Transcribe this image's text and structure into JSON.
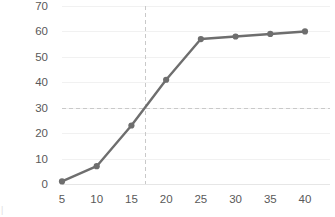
{
  "chart_data": {
    "type": "line",
    "title": "",
    "subtitle": "",
    "xlabel": "",
    "ylabel": "",
    "x": [
      5,
      10,
      15,
      20,
      25,
      30,
      35,
      40
    ],
    "series": [
      {
        "name": "series-1",
        "values": [
          1,
          7,
          23,
          41,
          57,
          58,
          59,
          60
        ],
        "color": "#6e6e6e",
        "marker": "circle"
      }
    ],
    "xlim": [
      5,
      40
    ],
    "ylim": [
      0,
      70
    ],
    "xticks": [
      5,
      10,
      15,
      20,
      25,
      30,
      35,
      40
    ],
    "yticks": [
      0,
      10,
      20,
      30,
      40,
      50,
      60,
      70
    ],
    "xtick_labels": [
      "5",
      "10",
      "15",
      "20",
      "25",
      "30",
      "35",
      "40"
    ],
    "ytick_labels": [
      "0",
      "10",
      "20",
      "30",
      "40",
      "50",
      "60",
      "70"
    ],
    "grid": {
      "horizontal": true,
      "vertical": false,
      "color": "#f1f1f1"
    },
    "legend": {
      "visible": false,
      "position": "none",
      "entries": []
    },
    "annotations": [
      {
        "name": "horizontal-reference-line",
        "orientation": "horizontal",
        "value": 30,
        "style": "dashed",
        "color": "#c9c9c9"
      },
      {
        "name": "vertical-reference-line",
        "orientation": "vertical",
        "value": 17,
        "style": "dashed",
        "color": "#c9c9c9"
      }
    ],
    "colors": {
      "series": "#6e6e6e",
      "grid": "#f1f1f1",
      "axis": "#e6e6e6",
      "tick_text": "#595959",
      "reference": "#c9c9c9",
      "background": "#ffffff"
    }
  },
  "corner_mark": "|"
}
